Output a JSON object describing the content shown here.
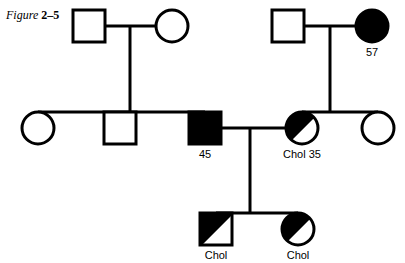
{
  "figure": {
    "caption_word": "Figure",
    "caption_number": "2–5"
  },
  "colors": {
    "stroke": "#000000",
    "fill_affected": "#000000",
    "fill_unaffected": "#ffffff",
    "background": "#ffffff"
  },
  "diagram": {
    "type": "pedigree-chart",
    "generations": 3,
    "line_width": 3,
    "symbols": {
      "square": "male",
      "circle": "female",
      "filled": "affected",
      "open": "unaffected",
      "half_filled": "carrier-or-partially-affected"
    },
    "individuals": [
      {
        "id": "I-1",
        "shape": "square",
        "sex": "male",
        "fill": "open",
        "generation": 1,
        "cx": 89,
        "cy": 26,
        "label": ""
      },
      {
        "id": "I-2",
        "shape": "circle",
        "sex": "female",
        "fill": "open",
        "generation": 1,
        "cx": 172,
        "cy": 26,
        "label": ""
      },
      {
        "id": "I-3",
        "shape": "square",
        "sex": "male",
        "fill": "open",
        "generation": 1,
        "cx": 288,
        "cy": 26,
        "label": ""
      },
      {
        "id": "I-4",
        "shape": "circle",
        "sex": "female",
        "fill": "filled",
        "generation": 1,
        "cx": 372,
        "cy": 26,
        "label": "57"
      },
      {
        "id": "II-1",
        "shape": "circle",
        "sex": "female",
        "fill": "open",
        "generation": 2,
        "cx": 38,
        "cy": 128,
        "label": ""
      },
      {
        "id": "II-2",
        "shape": "square",
        "sex": "male",
        "fill": "open",
        "generation": 2,
        "cx": 120,
        "cy": 128,
        "label": ""
      },
      {
        "id": "II-3",
        "shape": "square",
        "sex": "male",
        "fill": "filled",
        "generation": 2,
        "cx": 205,
        "cy": 128,
        "label": "45"
      },
      {
        "id": "II-4",
        "shape": "circle",
        "sex": "female",
        "fill": "half",
        "generation": 2,
        "cx": 302,
        "cy": 128,
        "label": "Chol 35"
      },
      {
        "id": "II-5",
        "shape": "circle",
        "sex": "female",
        "fill": "open",
        "generation": 2,
        "cx": 378,
        "cy": 128,
        "label": ""
      },
      {
        "id": "III-1",
        "shape": "square",
        "sex": "male",
        "fill": "half",
        "generation": 3,
        "cx": 216,
        "cy": 229,
        "label": "Chol"
      },
      {
        "id": "III-2",
        "shape": "circle",
        "sex": "female",
        "fill": "half",
        "generation": 3,
        "cx": 298,
        "cy": 229,
        "label": "Chol"
      }
    ],
    "labels": {
      "gen1_female_right": "57",
      "gen2_male_affected": "45",
      "gen2_female_half": "Chol 35",
      "gen3_male_half": "Chol",
      "gen3_female_half": "Chol"
    }
  }
}
